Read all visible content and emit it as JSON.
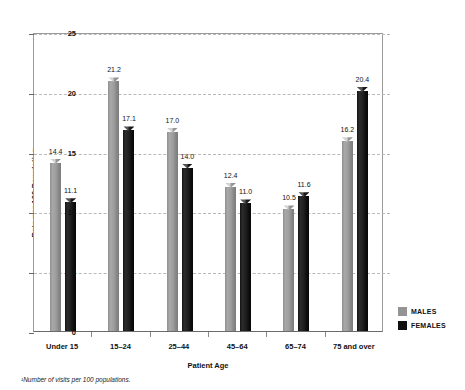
{
  "chart_data": {
    "type": "bar",
    "title": "",
    "xlabel": "Patient Age",
    "ylabel": "Rate per 100 Population",
    "categories": [
      "Under 15",
      "15–24",
      "25–44",
      "45–64",
      "65–74",
      "75 and over"
    ],
    "series": [
      {
        "name": "MALES",
        "color": "#949494",
        "values": [
          14.4,
          21.2,
          17.0,
          12.4,
          10.5,
          16.2
        ]
      },
      {
        "name": "FEMALES",
        "color": "#101010",
        "values": [
          11.1,
          17.1,
          14.0,
          11.0,
          11.6,
          20.4
        ]
      }
    ],
    "ylim": [
      0,
      25
    ],
    "yticks": [
      0,
      5,
      10,
      15,
      20,
      25
    ],
    "ytick_labels": [
      "0",
      "5",
      "10",
      "15",
      "20",
      "25"
    ],
    "grid": "horizontal-dashed",
    "legend_position": "right-bottom",
    "footnote": "¹Number of visits per 100 populations.",
    "value_labels": [
      {
        "group": "Under 15",
        "males": "14.4",
        "females": "11.1"
      },
      {
        "group": "15–24",
        "males": "21.2",
        "females": "17.1"
      },
      {
        "group": "25–44",
        "males": "17.0",
        "females": "14.0"
      },
      {
        "group": "45–64",
        "males": "12.4",
        "females": "11.0"
      },
      {
        "group": "65–74",
        "males": "10.5",
        "females": "11.6"
      },
      {
        "group": "75 and over",
        "males": "16.2",
        "females": "20.4"
      }
    ]
  },
  "legend": {
    "items": [
      {
        "label": "MALES",
        "swatch": "males"
      },
      {
        "label": "FEMALES",
        "swatch": "females"
      }
    ]
  },
  "top_artifact": "."
}
